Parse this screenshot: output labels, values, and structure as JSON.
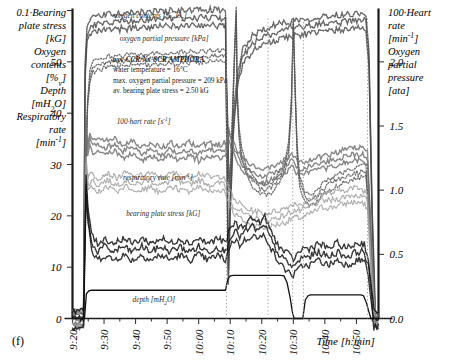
{
  "figure": {
    "panel_label": "(f)",
    "left_axis_title_lines": [
      "0.1·Bearing",
      "plate stress",
      "[kG]",
      "Oxygen",
      "contents",
      "[%v]",
      "Depth",
      "[mH2O]",
      "Respiratory",
      "rate",
      "[min-1]"
    ],
    "right_axis_title_lines": [
      "100·Heart",
      "rate",
      "[min-1]",
      "Oxygen",
      "partial",
      "pressure",
      "[ata]"
    ],
    "xlabel": "Time  [h:min]",
    "annotation": [
      "oxy-CCR/Nx-SCR AMPHORA",
      "water temperature = 16°C",
      "max. oxygen partial pressure = 209 kPa",
      "av. bearing plate stress = 2.50 kG"
    ],
    "curve_labels": [
      "oxygen contents [%v O2]",
      "oxygen partial pressure [kPa]",
      "100·hart rate [s-1]",
      "respiratory rate [min-1]",
      "bearing plate stress [kG]",
      "depth [mH2O]"
    ]
  },
  "chart_data": {
    "type": "line",
    "title": "",
    "xlabel": "Time  [h:min]",
    "ylabel": "0.1·Bearing plate stress [kG] / Oxygen contents [%v] / Depth [mH2O] / Respiratory rate [min-1]",
    "ylabel_right": "100·Heart rate [min-1] / Oxygen partial pressure [ata]",
    "grid": false,
    "legend": "inline-labels",
    "xticklabels": [
      "9:20",
      "9:30",
      "9:40",
      "9:50",
      "10:00",
      "10:10",
      "10:20",
      "10:30",
      "10:40",
      "10:50"
    ],
    "xtick_minor_count_between": 1,
    "ylim": [
      0,
      60
    ],
    "yticks": [
      0,
      10,
      20,
      30,
      40,
      50
    ],
    "yticklabels": [
      "0",
      "10",
      "20",
      "30",
      "40",
      "50"
    ],
    "ylim_right": [
      0.0,
      2.4
    ],
    "yticks_right": [
      0.0,
      0.5,
      1.0,
      1.5,
      2.0
    ],
    "yticklabels_right": [
      "0.0",
      "0.5",
      "1.0",
      "1.5",
      "2.0"
    ],
    "x_start": "9:20",
    "x_end": "10:57",
    "series": [
      {
        "name": "oxygen contents [%v O2]",
        "style": "dense-dotted-dark",
        "label_x": "9:33",
        "label_y": 58,
        "points": [
          [
            0.0,
            0.0
          ],
          [
            3.5,
            0.0
          ],
          [
            4.0,
            48
          ],
          [
            4.6,
            55
          ],
          [
            5.4,
            56.5
          ],
          [
            7.0,
            57.2
          ],
          [
            10.0,
            57.6
          ],
          [
            15.0,
            57.9
          ],
          [
            20.0,
            58.1
          ],
          [
            25.0,
            58.3
          ],
          [
            30.0,
            58.4
          ],
          [
            35.0,
            58.5
          ],
          [
            40.0,
            58.6
          ],
          [
            45.0,
            58.6
          ],
          [
            48.5,
            58.6
          ],
          [
            49.0,
            30
          ],
          [
            49.4,
            8
          ],
          [
            50.0,
            22
          ],
          [
            51.0,
            38
          ],
          [
            52.5,
            47
          ],
          [
            54.0,
            51
          ],
          [
            57.0,
            53.5
          ],
          [
            61.0,
            55.0
          ],
          [
            66.0,
            56.0
          ],
          [
            70.0,
            56.6
          ],
          [
            75.0,
            57.0
          ],
          [
            80.0,
            57.4
          ],
          [
            85.0,
            57.7
          ],
          [
            88.0,
            57.9
          ],
          [
            91.0,
            58.0
          ],
          [
            93.0,
            58.0
          ],
          [
            94.0,
            50
          ],
          [
            95.0,
            20
          ],
          [
            96.0,
            0.0
          ],
          [
            97.0,
            0.0
          ]
        ]
      },
      {
        "name": "oxygen partial pressure [kPa]",
        "style": "dotted-medium",
        "label_x": "9:35",
        "label_y": 53.5,
        "points": [
          [
            0.0,
            0.0
          ],
          [
            3.5,
            0.0
          ],
          [
            4.2,
            30
          ],
          [
            4.8,
            42
          ],
          [
            5.5,
            47
          ],
          [
            6.5,
            49
          ],
          [
            8.0,
            49.6
          ],
          [
            12.0,
            50.0
          ],
          [
            18.0,
            50.3
          ],
          [
            24.0,
            50.5
          ],
          [
            30.0,
            50.7
          ],
          [
            36.0,
            50.9
          ],
          [
            42.0,
            51.0
          ],
          [
            47.0,
            51.1
          ],
          [
            48.6,
            51.1
          ],
          [
            49.2,
            38
          ],
          [
            49.6,
            26
          ],
          [
            50.2,
            30
          ],
          [
            50.8,
            41
          ],
          [
            51.4,
            52
          ],
          [
            51.9,
            60
          ],
          [
            52.2,
            44
          ],
          [
            52.8,
            36
          ],
          [
            53.6,
            32
          ],
          [
            55.0,
            29
          ],
          [
            57.0,
            27
          ],
          [
            59.0,
            25.5
          ],
          [
            61.0,
            25.0
          ],
          [
            63.0,
            25.5
          ],
          [
            65.0,
            27
          ],
          [
            67.0,
            29
          ],
          [
            68.5,
            33
          ],
          [
            69.4,
            42
          ],
          [
            70.0,
            58
          ],
          [
            70.6,
            44
          ],
          [
            71.2,
            33
          ],
          [
            72.0,
            27
          ],
          [
            73.5,
            24
          ],
          [
            75.0,
            23
          ],
          [
            77.0,
            23.5
          ],
          [
            79.0,
            25
          ],
          [
            81.0,
            26
          ],
          [
            84.0,
            27
          ],
          [
            88.0,
            28
          ],
          [
            91.0,
            28.5
          ],
          [
            93.0,
            29
          ],
          [
            94.0,
            20
          ],
          [
            95.0,
            8
          ],
          [
            96.0,
            0.0
          ],
          [
            97.0,
            0.0
          ]
        ]
      },
      {
        "name": "100·hart rate [s-1]",
        "style": "dense-dotted-gray",
        "label_x": "9:34",
        "label_y": 37.5,
        "points": [
          [
            0.0,
            0.0
          ],
          [
            3.5,
            0.0
          ],
          [
            4.2,
            38
          ],
          [
            4.8,
            33
          ],
          [
            5.5,
            35
          ],
          [
            6.5,
            33.5
          ],
          [
            8.0,
            34
          ],
          [
            10.0,
            33
          ],
          [
            13.0,
            34
          ],
          [
            16.0,
            32.5
          ],
          [
            19.0,
            33.5
          ],
          [
            22.0,
            32
          ],
          [
            25.0,
            33
          ],
          [
            28.0,
            32
          ],
          [
            31.0,
            33
          ],
          [
            34.0,
            32
          ],
          [
            37.0,
            33
          ],
          [
            40.0,
            32
          ],
          [
            43.0,
            33
          ],
          [
            46.0,
            32.5
          ],
          [
            48.5,
            33
          ],
          [
            49.5,
            36
          ],
          [
            50.5,
            34
          ],
          [
            52.0,
            32
          ],
          [
            54.0,
            30
          ],
          [
            56.0,
            29
          ],
          [
            58.0,
            28
          ],
          [
            60.0,
            27.5
          ],
          [
            62.0,
            28
          ],
          [
            64.0,
            28.5
          ],
          [
            66.0,
            29
          ],
          [
            68.0,
            30
          ],
          [
            69.5,
            31
          ],
          [
            70.5,
            30
          ],
          [
            72.0,
            29
          ],
          [
            74.0,
            29.5
          ],
          [
            77.0,
            30
          ],
          [
            80.0,
            30.5
          ],
          [
            83.0,
            31
          ],
          [
            86.0,
            31.5
          ],
          [
            89.0,
            32
          ],
          [
            92.0,
            32
          ],
          [
            93.5,
            31
          ],
          [
            94.5,
            18
          ],
          [
            95.5,
            4
          ],
          [
            96.0,
            0.0
          ],
          [
            97.0,
            0.0
          ]
        ]
      },
      {
        "name": "respiratory rate [min-1]",
        "style": "dotted-light",
        "label_x": "9:36",
        "label_y": 26.5,
        "points": [
          [
            0.0,
            0.0
          ],
          [
            3.5,
            0.0
          ],
          [
            4.3,
            30
          ],
          [
            5.0,
            26
          ],
          [
            6.0,
            27
          ],
          [
            8.0,
            26
          ],
          [
            11.0,
            27
          ],
          [
            14.0,
            26
          ],
          [
            17.0,
            27
          ],
          [
            20.0,
            26
          ],
          [
            24.0,
            27
          ],
          [
            28.0,
            26
          ],
          [
            32.0,
            27
          ],
          [
            36.0,
            26
          ],
          [
            40.0,
            27
          ],
          [
            44.0,
            26
          ],
          [
            48.0,
            26.5
          ],
          [
            49.5,
            24
          ],
          [
            51.0,
            22
          ],
          [
            53.0,
            21
          ],
          [
            55.0,
            20
          ],
          [
            58.0,
            19.5
          ],
          [
            61.0,
            19
          ],
          [
            64.0,
            19.5
          ],
          [
            67.0,
            20
          ],
          [
            70.0,
            21
          ],
          [
            73.0,
            21
          ],
          [
            76.0,
            22
          ],
          [
            79.0,
            23
          ],
          [
            82.0,
            23
          ],
          [
            85.0,
            23.5
          ],
          [
            88.0,
            24
          ],
          [
            91.0,
            24
          ],
          [
            93.5,
            23
          ],
          [
            94.5,
            12
          ],
          [
            95.5,
            3
          ],
          [
            96.0,
            0.0
          ],
          [
            97.0,
            0.0
          ]
        ]
      },
      {
        "name": "bearing plate stress [kG]",
        "style": "dotted-black",
        "label_x": "9:37",
        "label_y": 19.5,
        "points": [
          [
            0.0,
            0.0
          ],
          [
            3.5,
            0.0
          ],
          [
            4.3,
            26
          ],
          [
            4.9,
            20
          ],
          [
            5.6,
            17
          ],
          [
            6.5,
            14
          ],
          [
            8.0,
            13
          ],
          [
            10.0,
            14
          ],
          [
            13.0,
            13
          ],
          [
            16.0,
            14
          ],
          [
            19.0,
            13
          ],
          [
            22.0,
            14
          ],
          [
            25.0,
            13
          ],
          [
            28.0,
            14
          ],
          [
            31.0,
            13
          ],
          [
            34.0,
            14
          ],
          [
            37.0,
            13
          ],
          [
            40.0,
            14
          ],
          [
            43.0,
            13
          ],
          [
            46.0,
            14
          ],
          [
            48.5,
            13
          ],
          [
            50.0,
            16
          ],
          [
            51.5,
            17
          ],
          [
            53.0,
            16
          ],
          [
            55.0,
            17
          ],
          [
            57.0,
            18
          ],
          [
            59.0,
            17
          ],
          [
            61.0,
            18
          ],
          [
            62.5,
            16
          ],
          [
            64.0,
            14
          ],
          [
            66.0,
            12
          ],
          [
            68.0,
            11
          ],
          [
            70.0,
            10
          ],
          [
            71.5,
            11
          ],
          [
            73.0,
            12
          ],
          [
            75.0,
            12
          ],
          [
            78.0,
            13
          ],
          [
            81.0,
            12
          ],
          [
            84.0,
            13
          ],
          [
            87.0,
            12
          ],
          [
            90.0,
            13
          ],
          [
            92.5,
            13
          ],
          [
            93.8,
            10
          ],
          [
            94.8,
            4
          ],
          [
            95.5,
            0.0
          ],
          [
            97.0,
            0.0
          ]
        ]
      },
      {
        "name": "depth [mH2O]",
        "style": "solid-black",
        "label_x": "9:39",
        "label_y": 2.8,
        "points": [
          [
            0.0,
            0.0
          ],
          [
            3.8,
            0.0
          ],
          [
            4.4,
            4.8
          ],
          [
            5.2,
            5.4
          ],
          [
            6.0,
            5.5
          ],
          [
            48.5,
            5.5
          ],
          [
            49.2,
            7.6
          ],
          [
            50.0,
            8.3
          ],
          [
            51.0,
            8.4
          ],
          [
            66.0,
            8.4
          ],
          [
            67.0,
            8.3
          ],
          [
            68.0,
            7.0
          ],
          [
            69.0,
            4.0
          ],
          [
            69.8,
            0.9
          ],
          [
            70.3,
            0.0
          ],
          [
            73.0,
            0.0
          ],
          [
            73.8,
            3.6
          ],
          [
            74.6,
            4.4
          ],
          [
            75.4,
            4.6
          ],
          [
            91.5,
            4.6
          ],
          [
            92.3,
            4.4
          ],
          [
            93.2,
            3.0
          ],
          [
            94.0,
            1.2
          ],
          [
            94.6,
            0.0
          ],
          [
            97.0,
            0.0
          ]
        ]
      }
    ]
  }
}
